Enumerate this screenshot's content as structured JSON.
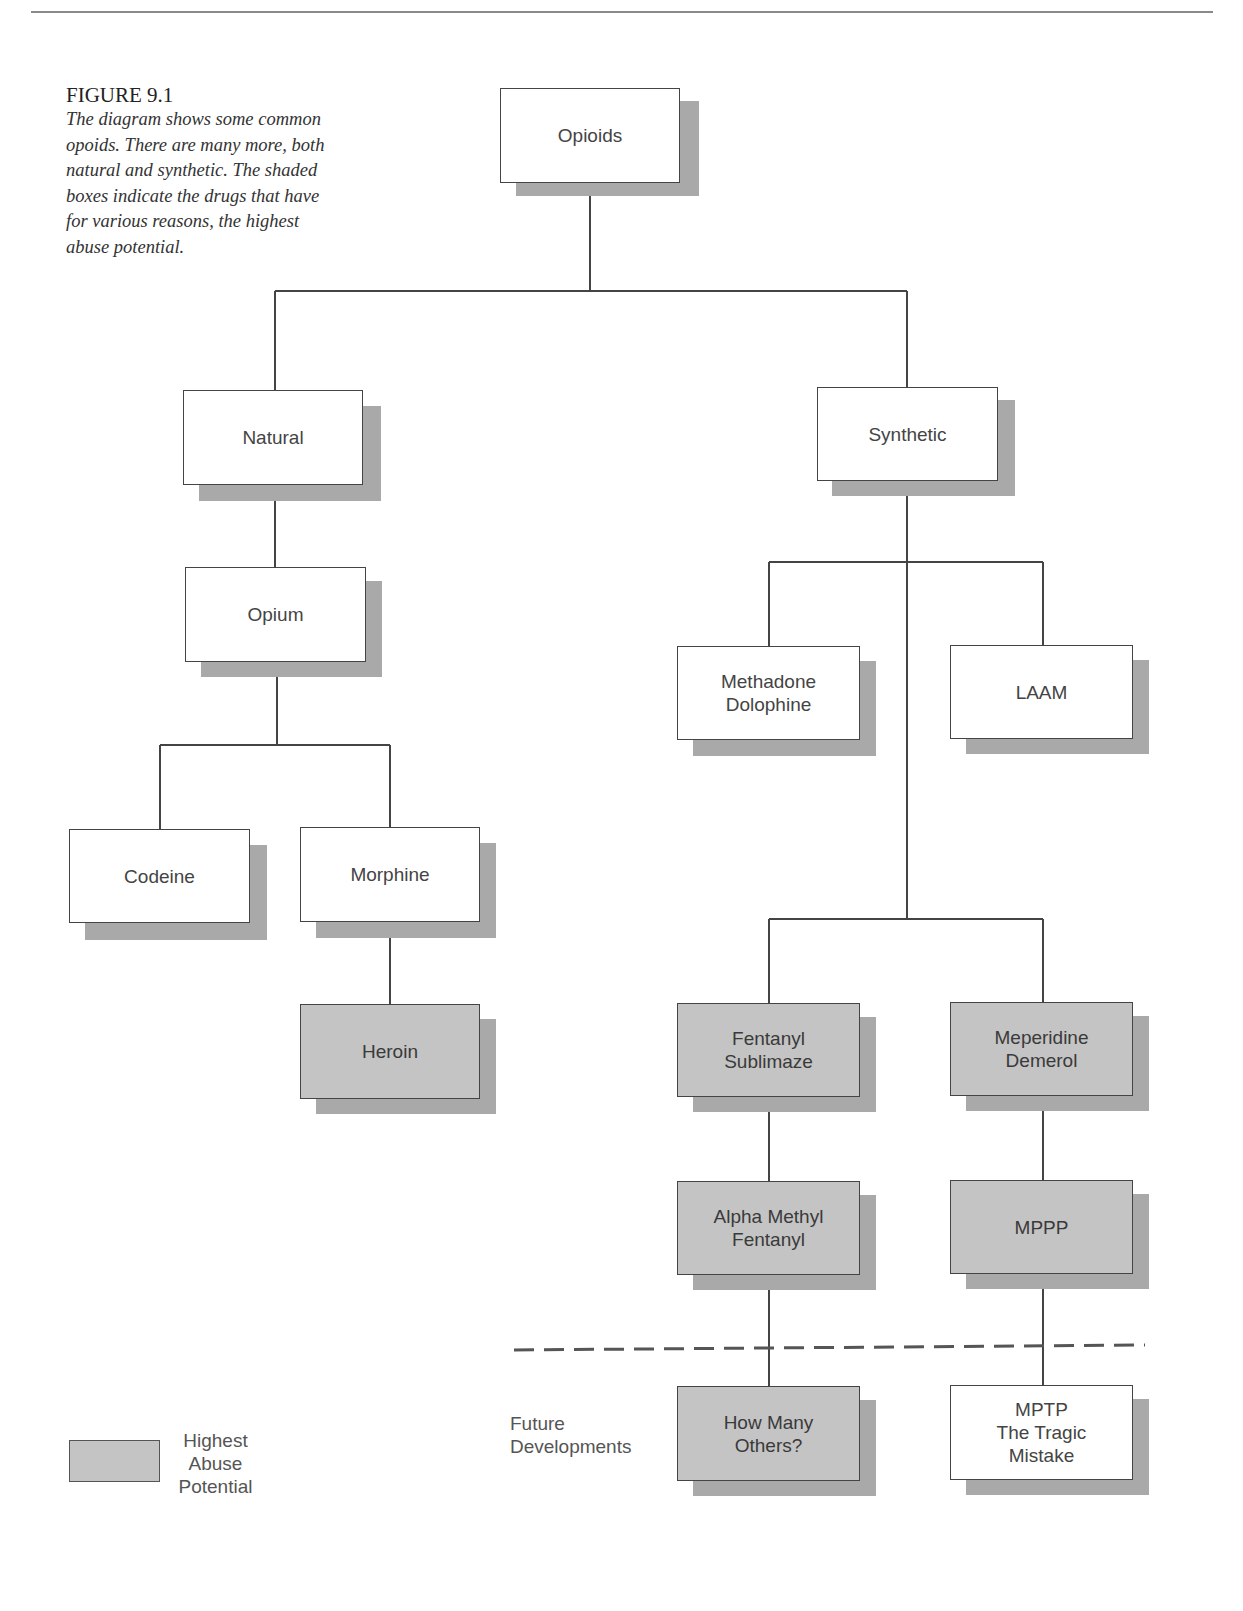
{
  "caption": {
    "title": "FIGURE 9.1",
    "text": "The diagram shows some common opoids. There are many more, both natural and synthetic. The shaded boxes indicate the drugs that have for various reasons, the highest abuse potential."
  },
  "nodes": {
    "opioids": {
      "label": "Opioids",
      "shaded": false
    },
    "natural": {
      "label": "Natural",
      "shaded": false
    },
    "synthetic": {
      "label": "Synthetic",
      "shaded": false
    },
    "opium": {
      "label": "Opium",
      "shaded": false
    },
    "codeine": {
      "label": "Codeine",
      "shaded": false
    },
    "morphine": {
      "label": "Morphine",
      "shaded": false
    },
    "heroin": {
      "label": "Heroin",
      "shaded": true
    },
    "methadone": {
      "label": "Methadone\nDolophine",
      "shaded": false
    },
    "laam": {
      "label": "LAAM",
      "shaded": false
    },
    "fentanyl": {
      "label": "Fentanyl\nSublimaze",
      "shaded": true
    },
    "meperidine": {
      "label": "Meperidine\nDemerol",
      "shaded": true
    },
    "alpha_methyl_fentanyl": {
      "label": "Alpha Methyl\nFentanyl",
      "shaded": true
    },
    "mppp": {
      "label": "MPPP",
      "shaded": true
    },
    "how_many_others": {
      "label": "How Many\nOthers?",
      "shaded": true
    },
    "mptp": {
      "label": "MPTP\nThe Tragic\nMistake",
      "shaded": false
    }
  },
  "edges": [
    [
      "opioids",
      "natural"
    ],
    [
      "opioids",
      "synthetic"
    ],
    [
      "natural",
      "opium"
    ],
    [
      "opium",
      "codeine"
    ],
    [
      "opium",
      "morphine"
    ],
    [
      "morphine",
      "heroin"
    ],
    [
      "synthetic",
      "methadone"
    ],
    [
      "synthetic",
      "laam"
    ],
    [
      "synthetic",
      "fentanyl"
    ],
    [
      "synthetic",
      "meperidine"
    ],
    [
      "fentanyl",
      "alpha_methyl_fentanyl"
    ],
    [
      "meperidine",
      "mppp"
    ],
    [
      "alpha_methyl_fentanyl",
      "how_many_others"
    ],
    [
      "mppp",
      "mptp"
    ]
  ],
  "annotations": {
    "future_developments": "Future\nDevelopments"
  },
  "legend": {
    "label": "Highest\nAbuse\nPotential"
  },
  "colors": {
    "shaded_fill": "#c4c4c4",
    "shadow": "#a9a9a9",
    "line": "#444444"
  }
}
